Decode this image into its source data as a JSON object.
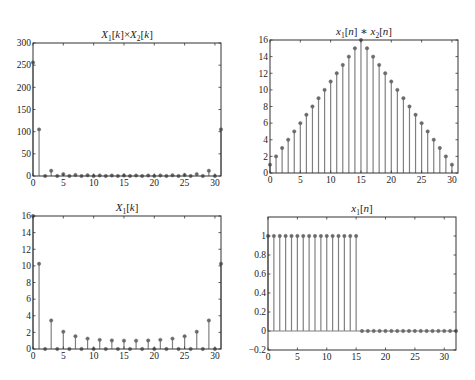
{
  "figure": {
    "background": "#ffffff",
    "stem_color": "#808080",
    "marker_color": "#6a6a6a",
    "axis_color": "#333333"
  },
  "chart_data": [
    {
      "id": "plot1",
      "type": "stem",
      "title_main": "X",
      "title": "X1[k]×X2[k]",
      "title_parts": [
        {
          "t": "X",
          "i": true
        },
        {
          "t": "1",
          "sub": true
        },
        {
          "t": "[",
          "i": false
        },
        {
          "t": "k",
          "i": true
        },
        {
          "t": "]×",
          "i": false
        },
        {
          "t": "X",
          "i": true
        },
        {
          "t": "2",
          "sub": true
        },
        {
          "t": "[",
          "i": false
        },
        {
          "t": "k",
          "i": true
        },
        {
          "t": "]",
          "i": false
        }
      ],
      "box": {
        "left": 33,
        "top": 43,
        "right": 221,
        "bottom": 176
      },
      "xlim": [
        0,
        31
      ],
      "ylim": [
        0,
        300
      ],
      "xticks": [
        0,
        5,
        10,
        15,
        20,
        25,
        30
      ],
      "yticks": [
        0,
        50,
        100,
        150,
        200,
        250,
        300
      ],
      "x": [
        0,
        1,
        2,
        3,
        4,
        5,
        6,
        7,
        8,
        9,
        10,
        11,
        12,
        13,
        14,
        15,
        16,
        17,
        18,
        19,
        20,
        21,
        22,
        23,
        24,
        25,
        26,
        27,
        28,
        29,
        30,
        31
      ],
      "values": [
        256,
        105.1,
        0,
        11.8,
        0,
        4.3,
        0,
        2.3,
        0,
        1.6,
        0,
        1.2,
        0,
        1.06,
        0,
        1.0,
        0,
        1.0,
        0,
        1.06,
        0,
        1.2,
        0,
        1.6,
        0,
        2.3,
        0,
        4.3,
        0,
        11.8,
        0,
        105.1
      ]
    },
    {
      "id": "plot2",
      "type": "stem",
      "title": "x1[n]∗x2[n]",
      "title_parts": [
        {
          "t": "x",
          "i": true
        },
        {
          "t": "1",
          "sub": true
        },
        {
          "t": "[",
          "i": false
        },
        {
          "t": "n",
          "i": true
        },
        {
          "t": "] ∗ ",
          "i": false
        },
        {
          "t": "x",
          "i": true
        },
        {
          "t": "2",
          "sub": true
        },
        {
          "t": "[",
          "i": false
        },
        {
          "t": "n",
          "i": true
        },
        {
          "t": "]",
          "i": false
        }
      ],
      "box": {
        "left": 270,
        "top": 40,
        "right": 458,
        "bottom": 173
      },
      "xlim": [
        0,
        31
      ],
      "ylim": [
        0,
        16
      ],
      "xticks": [
        0,
        5,
        10,
        15,
        20,
        25,
        30
      ],
      "yticks": [
        0,
        2,
        4,
        6,
        8,
        10,
        12,
        14,
        16
      ],
      "x": [
        0,
        1,
        2,
        3,
        4,
        5,
        6,
        7,
        8,
        9,
        10,
        11,
        12,
        13,
        14,
        15,
        16,
        17,
        18,
        19,
        20,
        21,
        22,
        23,
        24,
        25,
        26,
        27,
        28,
        29,
        30
      ],
      "values": [
        1,
        2,
        3,
        4,
        5,
        6,
        7,
        8,
        9,
        10,
        11,
        12,
        13,
        14,
        15,
        16,
        15,
        14,
        13,
        12,
        11,
        10,
        9,
        8,
        7,
        6,
        5,
        4,
        3,
        2,
        1
      ]
    },
    {
      "id": "plot3",
      "type": "stem",
      "title": "X1[k]",
      "title_parts": [
        {
          "t": "X",
          "i": true
        },
        {
          "t": "1",
          "sub": true
        },
        {
          "t": "[",
          "i": false
        },
        {
          "t": "k",
          "i": true
        },
        {
          "t": "]",
          "i": false
        }
      ],
      "box": {
        "left": 33,
        "top": 216,
        "right": 221,
        "bottom": 349
      },
      "xlim": [
        0,
        31
      ],
      "ylim": [
        0,
        16
      ],
      "xticks": [
        0,
        5,
        10,
        15,
        20,
        25,
        30
      ],
      "yticks": [
        0,
        2,
        4,
        6,
        8,
        10,
        12,
        14,
        16
      ],
      "x": [
        0,
        1,
        2,
        3,
        4,
        5,
        6,
        7,
        8,
        9,
        10,
        11,
        12,
        13,
        14,
        15,
        16,
        17,
        18,
        19,
        20,
        21,
        22,
        23,
        24,
        25,
        26,
        27,
        28,
        29,
        30,
        31
      ],
      "values": [
        16,
        10.25,
        0,
        3.43,
        0,
        2.08,
        0,
        1.53,
        0,
        1.25,
        0,
        1.1,
        0,
        1.03,
        0,
        1.0,
        0,
        1.0,
        0,
        1.03,
        0,
        1.1,
        0,
        1.25,
        0,
        1.53,
        0,
        2.08,
        0,
        3.43,
        0,
        10.25
      ]
    },
    {
      "id": "plot4",
      "type": "stem",
      "title": "x1[n]",
      "title_parts": [
        {
          "t": "x",
          "i": true
        },
        {
          "t": "1",
          "sub": true
        },
        {
          "t": "[",
          "i": false
        },
        {
          "t": "n",
          "i": true
        },
        {
          "t": "]",
          "i": false
        }
      ],
      "box": {
        "left": 268,
        "top": 217,
        "right": 456,
        "bottom": 350
      },
      "xlim": [
        0,
        32
      ],
      "ylim": [
        -0.2,
        1.2
      ],
      "xticks": [
        0,
        5,
        10,
        15,
        20,
        25,
        30
      ],
      "yticks": [
        -0.2,
        0,
        0.2,
        0.4,
        0.6,
        0.8,
        1
      ],
      "ytick_labels": [
        "−0.2",
        "0",
        "0.2",
        "0.4",
        "0.6",
        "0.8",
        "1"
      ],
      "baseline": 0,
      "x": [
        0,
        1,
        2,
        3,
        4,
        5,
        6,
        7,
        8,
        9,
        10,
        11,
        12,
        13,
        14,
        15,
        16,
        17,
        18,
        19,
        20,
        21,
        22,
        23,
        24,
        25,
        26,
        27,
        28,
        29,
        30,
        31,
        32
      ],
      "values": [
        1,
        1,
        1,
        1,
        1,
        1,
        1,
        1,
        1,
        1,
        1,
        1,
        1,
        1,
        1,
        1,
        0,
        0,
        0,
        0,
        0,
        0,
        0,
        0,
        0,
        0,
        0,
        0,
        0,
        0,
        0,
        0,
        0
      ]
    }
  ]
}
